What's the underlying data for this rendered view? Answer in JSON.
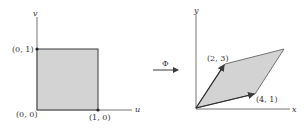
{
  "colors": {
    "fill": "#d3d3d3",
    "stroke": "#3a3a3a",
    "axis": "#777777",
    "text": "#333333"
  },
  "left_panel": {
    "axis_labels": {
      "horizontal": "u",
      "vertical": "v"
    },
    "points": [
      {
        "label": "(0, 0)",
        "coords": [
          0,
          0
        ]
      },
      {
        "label": "(1, 0)",
        "coords": [
          1,
          0
        ]
      },
      {
        "label": "(0, 1)",
        "coords": [
          0,
          1
        ]
      }
    ],
    "shape": "unit square"
  },
  "mapping": {
    "label": "Φ"
  },
  "right_panel": {
    "axis_labels": {
      "horizontal": "x",
      "vertical": "y"
    },
    "points": [
      {
        "label": "(2, 3)",
        "coords": [
          2,
          3
        ]
      },
      {
        "label": "(4, 1)",
        "coords": [
          4,
          1
        ]
      }
    ],
    "shape": "parallelogram spanned by (2, 3) and (4, 1)"
  }
}
